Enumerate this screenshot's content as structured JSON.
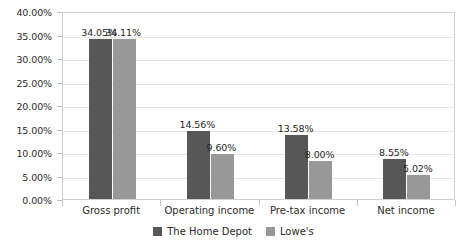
{
  "chart_data": {
    "type": "bar",
    "title": "",
    "subtitle": "",
    "xlabel": "",
    "ylabel": "",
    "categories": [
      "Gross profit",
      "Operating income",
      "Pre-tax income",
      "Net income"
    ],
    "series": [
      {
        "name": "The Home Depot",
        "color": "#575757",
        "values": [
          34.05,
          14.56,
          13.58,
          8.55
        ],
        "labels": [
          "34.05%",
          "14.56%",
          "13.58%",
          "8.55%"
        ]
      },
      {
        "name": "Lowe's",
        "color": "#989898",
        "values": [
          34.11,
          9.6,
          8.0,
          5.02
        ],
        "labels": [
          "34.11%",
          "9.60%",
          "8.00%",
          "5.02%"
        ]
      }
    ],
    "ylim": [
      0,
      40
    ],
    "ytick_values": [
      0,
      5,
      10,
      15,
      20,
      25,
      30,
      35,
      40
    ],
    "ytick_labels": [
      "0.00%",
      "5.00%",
      "10.00%",
      "15.00%",
      "20.00%",
      "25.00%",
      "30.00%",
      "35.00%",
      "40.00%"
    ],
    "grid": true,
    "legend_position": "bottom",
    "value_suffix": "%"
  },
  "legend": {
    "items": [
      {
        "label": "The Home Depot",
        "color": "#575757"
      },
      {
        "label": "Lowe's",
        "color": "#989898"
      }
    ]
  },
  "colors": {
    "series_home_depot": "#575757",
    "series_lowes": "#989898",
    "gridline": "#e6e6e6",
    "plot_border": "#d0d0d0",
    "text": "#2b2b2b",
    "background": "#ffffff"
  }
}
